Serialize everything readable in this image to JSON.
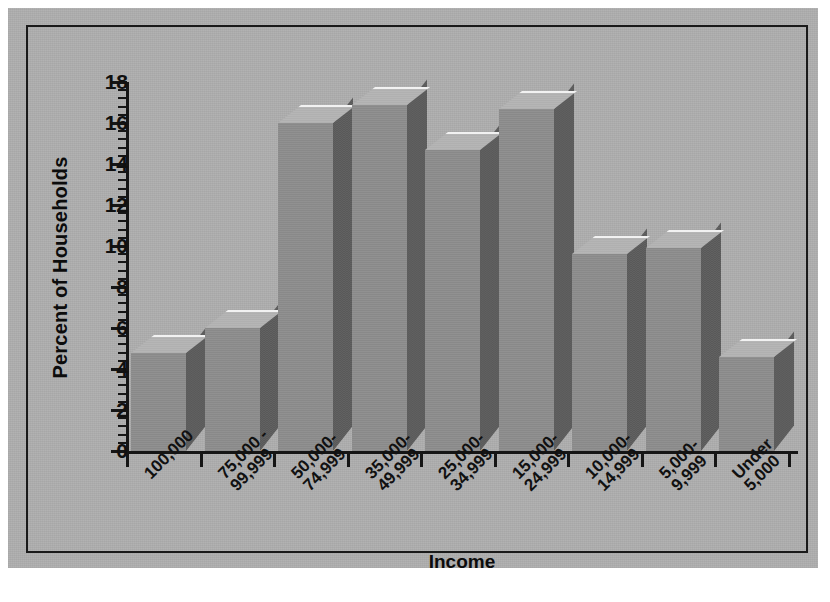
{
  "figure": {
    "background_color": "#aeaeae",
    "frame_color": "#1a1a1a",
    "bar_front_color": "#8d8d8d",
    "bar_side_color": "#5c5c5c",
    "bar_top_color": "#b4b4b4"
  },
  "chart_data": {
    "type": "bar",
    "title": "",
    "xlabel": "Income",
    "ylabel": "Percent of Households",
    "ylim": [
      0,
      18
    ],
    "ytick_step": 2,
    "minor_ticks": true,
    "grid": false,
    "legend": null,
    "three_d": true,
    "categories": [
      "100,000",
      "75,000 -\n99,999",
      "50,000-\n74,999",
      "35,000-\n49,999",
      "25,000-\n34,999",
      "15,000-\n24,999",
      "10,000-\n14,999",
      "5,000-\n9,999",
      "Under\n5,000"
    ],
    "values": [
      4.8,
      6.0,
      16.0,
      16.9,
      14.7,
      16.7,
      9.6,
      9.9,
      4.6
    ],
    "ytick_labels": [
      "0",
      "2",
      "4",
      "6",
      "8",
      "10",
      "12",
      "14",
      "16",
      "18"
    ],
    "ytick_values": [
      0,
      2,
      4,
      6,
      8,
      10,
      12,
      14,
      16,
      18
    ]
  }
}
